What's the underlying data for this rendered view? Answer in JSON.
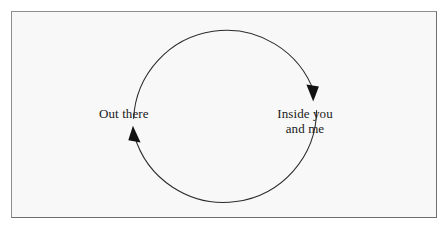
{
  "diagram": {
    "type": "cycle-diagram",
    "title": "",
    "background_color": "#f8f8f8",
    "page_color": "#ffffff",
    "frame": {
      "border_color": "#8e8e8e",
      "name": "figure-frame"
    },
    "circle": {
      "center_x": 225,
      "center_y": 113,
      "radius": 93,
      "stroke_color": "#2b2b2b",
      "stroke_width": 1
    },
    "arrows": [
      {
        "name": "arrow-clockwise-right",
        "direction": "down",
        "tip_x": 313,
        "tip_y": 101,
        "color": "#111111"
      },
      {
        "name": "arrow-clockwise-left",
        "direction": "up",
        "tip_x": 133,
        "tip_y": 126,
        "color": "#111111"
      }
    ],
    "labels": {
      "left": {
        "text": "Out there",
        "lines": [
          "Out there"
        ]
      },
      "right": {
        "text": "Inside you and me",
        "lines": [
          "Inside you",
          "and me"
        ]
      }
    }
  }
}
